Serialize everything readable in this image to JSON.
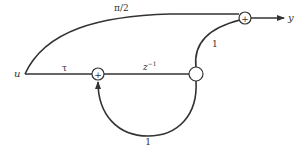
{
  "diagram": {
    "type": "signal-flow-graph",
    "input": {
      "label": "u"
    },
    "output": {
      "label": "y"
    },
    "nodes": [
      {
        "id": "input",
        "label": "u"
      },
      {
        "id": "sum1",
        "symbol": "+"
      },
      {
        "id": "state",
        "symbol": ""
      },
      {
        "id": "sum2",
        "symbol": "+"
      },
      {
        "id": "output",
        "label": "y"
      }
    ],
    "edges": [
      {
        "from": "input",
        "to": "sum1",
        "gain": "τ"
      },
      {
        "from": "sum1",
        "to": "state",
        "gain": "z",
        "gain_exp": "−1"
      },
      {
        "from": "state",
        "to": "sum1",
        "gain": "1",
        "kind": "feedback"
      },
      {
        "from": "input",
        "to": "sum2",
        "gain": "π/2",
        "kind": "feedforward"
      },
      {
        "from": "state",
        "to": "sum2",
        "gain": "1"
      },
      {
        "from": "sum2",
        "to": "output",
        "gain": ""
      }
    ],
    "colors": {
      "stroke": "#333333",
      "background": "#ffffff"
    }
  }
}
